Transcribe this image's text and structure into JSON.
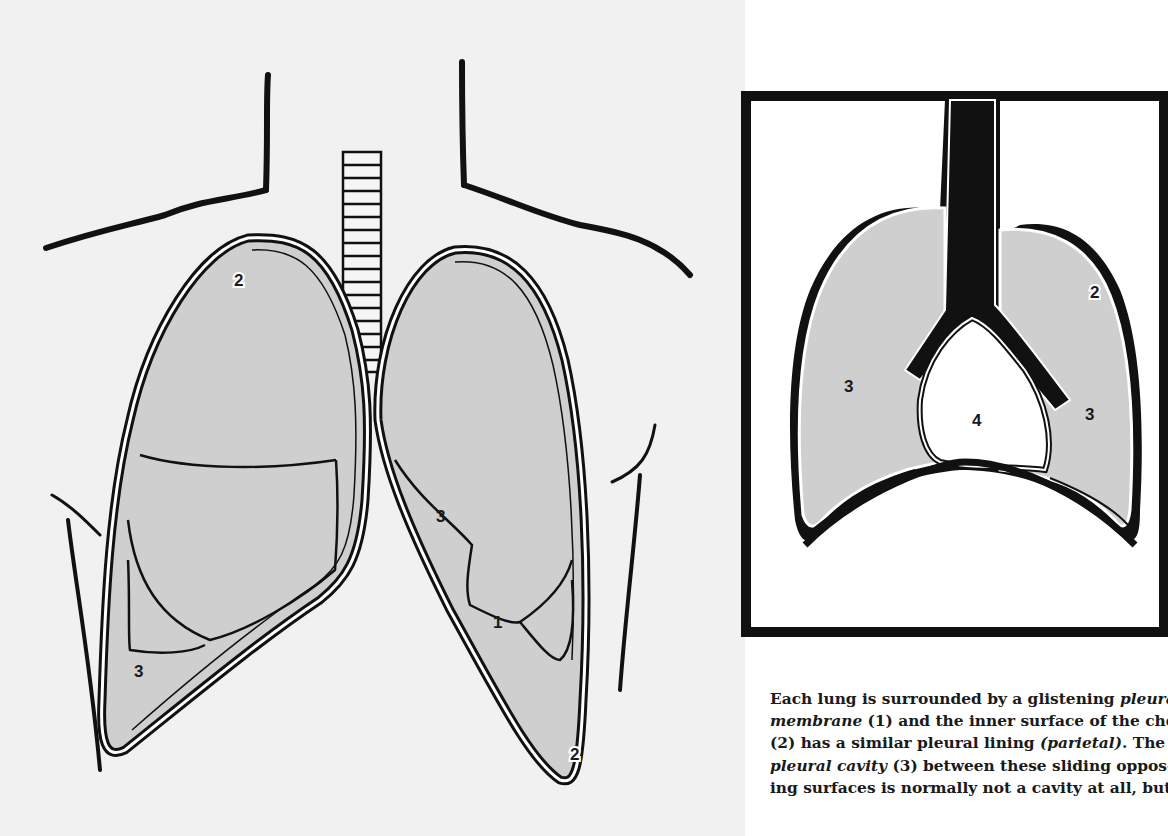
{
  "figure": {
    "main_view": {
      "title": "Front view of chest with lungs",
      "labels": [
        {
          "id": "right-lung-parietal",
          "text": "2"
        },
        {
          "id": "right-lung-cavity",
          "text": "3"
        },
        {
          "id": "left-lung-cavity",
          "text": "3"
        },
        {
          "id": "left-lung-membrane",
          "text": "1"
        },
        {
          "id": "left-lung-parietal",
          "text": "2"
        }
      ]
    },
    "inset_view": {
      "title": "Cross-section inset",
      "labels": [
        {
          "id": "inset-parietal",
          "text": "2"
        },
        {
          "id": "inset-left-cavity",
          "text": "3"
        },
        {
          "id": "inset-right-cavity",
          "text": "3"
        },
        {
          "id": "inset-heart",
          "text": "4"
        }
      ]
    },
    "colors": {
      "lung_fill": "#cfcfcf",
      "outline": "#111111",
      "background": "#f1f1f1"
    }
  },
  "caption": {
    "lines": [
      [
        {
          "t": "Each lung is surrounded by a glistening ",
          "i": false
        },
        {
          "t": "pleural",
          "i": true
        }
      ],
      [
        {
          "t": "membrane",
          "i": true
        },
        {
          "t": " (1) and the inner surface of the chest",
          "i": false
        }
      ],
      [
        {
          "t": "(2) has a similar pleural lining ",
          "i": false
        },
        {
          "t": "(parietal)",
          "i": true
        },
        {
          "t": ". The",
          "i": false
        }
      ],
      [
        {
          "t": "pleural cavity",
          "i": true
        },
        {
          "t": " (3) between these sliding oppos-",
          "i": false
        }
      ],
      [
        {
          "t": "ing surfaces is normally not a cavity at all, but",
          "i": false
        }
      ]
    ]
  }
}
